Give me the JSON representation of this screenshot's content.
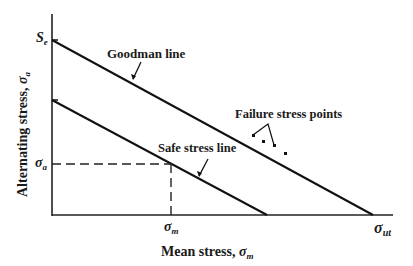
{
  "diagram": {
    "x_axis_label": "Mean stress, ",
    "x_axis_symbol": "σ",
    "x_axis_symbol_sub": "m",
    "y_axis_label": "Alternating stress, ",
    "y_axis_symbol": "σ",
    "y_axis_symbol_sub": "a",
    "labels": {
      "goodman_line": "Goodman line",
      "safe_stress_line": "Safe stress line",
      "failure_points": "Failure stress points"
    },
    "ticks": {
      "se": "S",
      "se_sub": "e",
      "sigma_a": "σ",
      "sigma_a_sub": "a",
      "sigma_m": "σ",
      "sigma_m_sub": "m",
      "sigma_ut": "σ",
      "sigma_ut_sub": "ut"
    }
  }
}
